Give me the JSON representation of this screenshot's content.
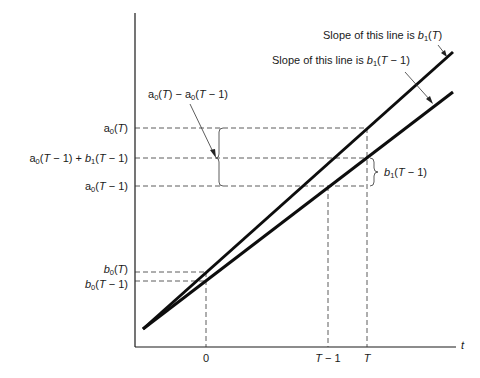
{
  "figure": {
    "x_axis_label": "t",
    "x_ticks": [
      {
        "label": "0",
        "x": 206
      },
      {
        "label": "T − 1",
        "x": 328
      },
      {
        "label": "T",
        "x": 367
      }
    ],
    "y_levels": [
      {
        "id": "a0T",
        "label": "a₀(T)",
        "y": 128
      },
      {
        "id": "mid",
        "label": "a₀(T − 1) + b₁(T − 1)",
        "y": 158
      },
      {
        "id": "a0Tm1",
        "label": "a₀(T − 1)",
        "y": 186
      },
      {
        "id": "b0T",
        "label": "b₀(T)",
        "y": 272
      },
      {
        "id": "b0Tm1",
        "label": "b₀(T − 1)",
        "y": 281
      }
    ],
    "annotations": {
      "slope_T": "Slope of this line is b₁(T)",
      "slope_Tm1": "Slope of this line is b₁(T − 1)",
      "diff_label": "a₀(T) − a₀(T − 1)",
      "brace_label": "b₁(T − 1)"
    },
    "lines": [
      {
        "name": "line-T",
        "slope_label": "b₁(T)",
        "intercept_label": "b₀(T)",
        "from": [
          143,
          329
        ],
        "to": [
          453,
          52
        ]
      },
      {
        "name": "line-T-1",
        "slope_label": "b₁(T − 1)",
        "intercept_label": "b₀(T − 1)",
        "from": [
          143,
          329
        ],
        "to": [
          453,
          92
        ]
      }
    ]
  }
}
